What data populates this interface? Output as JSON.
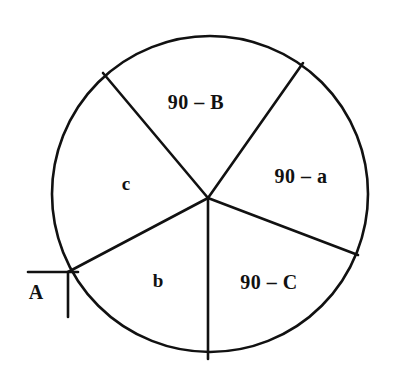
{
  "figure": {
    "background_color": "#ffffff",
    "line_color": "#111111",
    "circle": {
      "center_x": 210,
      "center_y": 194,
      "radius": 158
    },
    "hub": {
      "x": 208,
      "y": 198
    }
  },
  "labels": {
    "top": "90 – B",
    "right": "90 – a",
    "bottom_right": "90 – C",
    "left": "c",
    "bottom_left": "b",
    "vertex": "A"
  },
  "label_positions": {
    "top": {
      "x": 196,
      "y": 104
    },
    "right": {
      "x": 301,
      "y": 178
    },
    "bottom_right": {
      "x": 269,
      "y": 284
    },
    "left": {
      "x": 126,
      "y": 186
    },
    "bottom_left": {
      "x": 158,
      "y": 283
    },
    "vertex": {
      "x": 36,
      "y": 294
    }
  },
  "radii": [
    {
      "name": "upper-left",
      "x": 103,
      "y": 73
    },
    {
      "name": "upper-right",
      "x": 303,
      "y": 63
    },
    {
      "name": "lower-right",
      "x": 358,
      "y": 255
    },
    {
      "name": "bottom",
      "x": 208,
      "y": 359
    },
    {
      "name": "lower-left",
      "x": 68,
      "y": 272
    }
  ],
  "right_angle_marker": {
    "vertex_x": 68,
    "vertex_y": 272,
    "horizontal_start_x": 28,
    "horizontal_end_x": 78,
    "vertical_end_y": 317
  }
}
